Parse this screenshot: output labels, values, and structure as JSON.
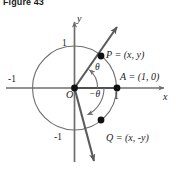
{
  "caption": "Figure 43",
  "figure": {
    "points": [
      {
        "id": "P",
        "label": "P = (x, y)",
        "px": 101,
        "py": 56,
        "on_circle": true
      },
      {
        "id": "Q",
        "label": "Q = (x, -y)",
        "px": 101,
        "py": 120,
        "on_circle": true
      },
      {
        "id": "A",
        "label": "A = (1, 0)",
        "px": 117,
        "py": 88,
        "on_circle": true
      },
      {
        "id": "O",
        "label": "O",
        "px": 74.5,
        "py": 88,
        "on_circle": false
      }
    ],
    "axis_labels": {
      "x": "x",
      "y": "y"
    },
    "tick_labels": {
      "x_positive": "1",
      "x_negative": "-1",
      "y_positive": "1",
      "y_negative": "-1"
    },
    "angle_labels": {
      "positive": "θ",
      "negative": "−θ"
    },
    "circle": {
      "cx": 74.5,
      "cy": 88,
      "r": 42
    },
    "terminal_line": {
      "arrow_start": {
        "x": 93,
        "y": 163
      },
      "arrow_end": {
        "x": 118,
        "y": 26
      }
    },
    "colors": {
      "stroke": "#5a5a5a",
      "axis": "#6e6e6e",
      "point_fill": "#111111",
      "text": "#1a1a1a",
      "background": "#ffffff"
    }
  }
}
